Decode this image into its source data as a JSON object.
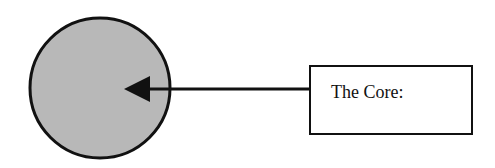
{
  "diagram": {
    "label": "The Core:",
    "colors": {
      "circle_fill": "#b8b8b8",
      "stroke": "#111111",
      "background": "#ffffff"
    },
    "elements": [
      {
        "type": "circle",
        "name": "core-circle"
      },
      {
        "type": "arrow",
        "from": "label-box",
        "to": "core-circle"
      },
      {
        "type": "box",
        "name": "label-box",
        "text": "The Core:"
      }
    ]
  }
}
